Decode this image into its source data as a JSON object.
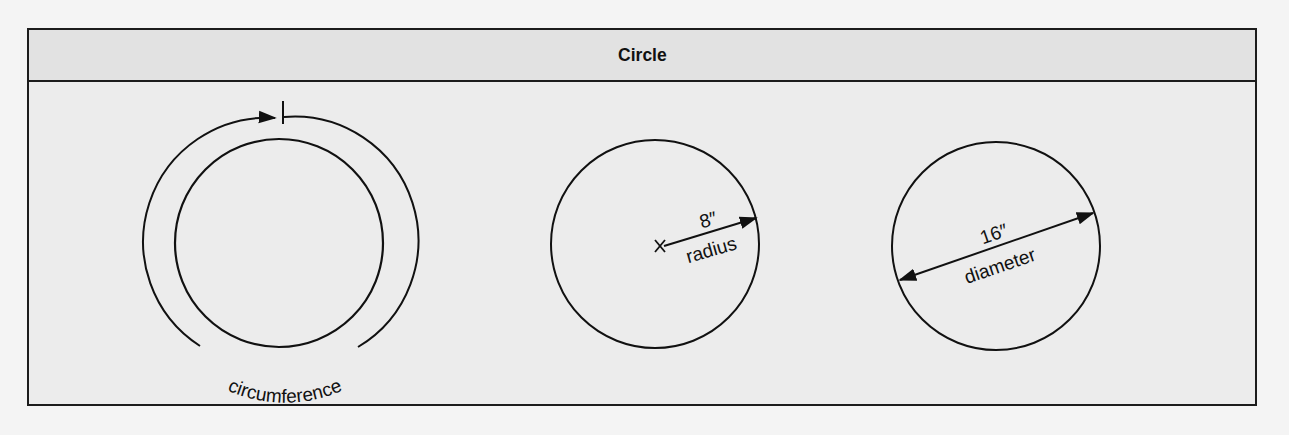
{
  "title": "Circle",
  "figures": [
    {
      "name": "circumference",
      "label": "circumference"
    },
    {
      "name": "radius",
      "measure": "8″",
      "label": "radius"
    },
    {
      "name": "diameter",
      "measure": "16″",
      "label": "diameter"
    }
  ],
  "colors": {
    "line": "#111111",
    "panel": "#ececec",
    "header": "#e2e2e2"
  }
}
